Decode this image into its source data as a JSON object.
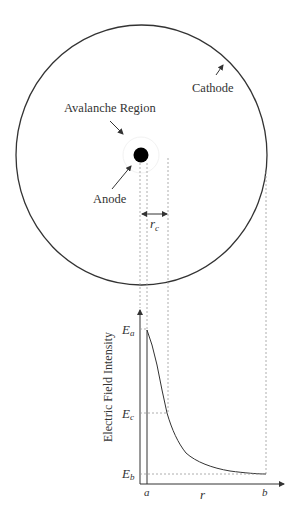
{
  "diagram": {
    "labels": {
      "cathode": "Cathode",
      "avalanche_region": "Avalanche Region",
      "anode": "Anode",
      "rc_main": "r",
      "rc_sub": "c"
    },
    "graph": {
      "ylabel": "Electric Field Intensity",
      "xlabel": "r",
      "y_ticks": {
        "Ea_main": "E",
        "Ea_sub": "a",
        "Ec_main": "E",
        "Ec_sub": "c",
        "Eb_main": "E",
        "Eb_sub": "b"
      },
      "x_ticks": {
        "a": "a",
        "b": "b"
      }
    },
    "colors": {
      "line": "#333333",
      "dash": "#9a9a9a",
      "anode": "#000000"
    }
  }
}
